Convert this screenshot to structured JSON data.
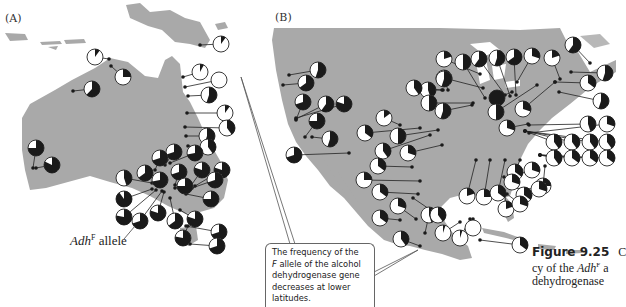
{
  "figure": {
    "panel_a_label": "(A)",
    "panel_b_label": "(B)",
    "allele_label": {
      "gene": "Adh",
      "superscript": "F",
      "suffix": " allele"
    },
    "callout_text": [
      "The frequency of the",
      "F allele of the alcohol",
      "dehydrogenase gene",
      "decreases at lower",
      "latitudes."
    ],
    "caption": {
      "number": "Figure 9.25",
      "lines": [
        "cy of the Adh",
        "dehydrogenase"
      ],
      "cut_first": "C",
      "superscript": "F",
      "line1_suffix": " a"
    }
  },
  "colors": {
    "land": "#a9a9a9",
    "pie_dark": "#1a1a1a",
    "pie_light": "#ffffff",
    "line": "#222222"
  },
  "chart_data": [
    {
      "type": "pie-map",
      "title": "(A) Australia — AdhF allele frequency",
      "legend": "Adh^F allele (dark sector)",
      "pies": [
        {
          "x": 95,
          "y": 57,
          "f": 0.1,
          "dot": [
            109,
            59
          ]
        },
        {
          "x": 123,
          "y": 77,
          "f": 0.25,
          "dot": [
            111,
            66
          ]
        },
        {
          "x": 92,
          "y": 89,
          "f": 0.62,
          "dot": [
            73,
            91
          ]
        },
        {
          "x": 221,
          "y": 44,
          "f": 0.1,
          "dot": [
            200,
            45
          ]
        },
        {
          "x": 200,
          "y": 72,
          "f": 0.08,
          "dot": [
            183,
            77
          ]
        },
        {
          "x": 219,
          "y": 80,
          "f": 0.0,
          "dot": [
            185,
            87
          ]
        },
        {
          "x": 209,
          "y": 95,
          "f": 0.55,
          "dot": [
            188,
            96
          ]
        },
        {
          "x": 225,
          "y": 113,
          "f": 0.1,
          "dot": [
            187,
            113
          ]
        },
        {
          "x": 227,
          "y": 128,
          "f": 0.4,
          "dot": [
            185,
            127
          ]
        },
        {
          "x": 207,
          "y": 136,
          "f": 0.55,
          "dot": [
            186,
            136
          ]
        },
        {
          "x": 36,
          "y": 148,
          "f": 0.75,
          "dot": [
            33,
            168
          ]
        },
        {
          "x": 52,
          "y": 165,
          "f": 0.82,
          "dot": [
            36,
            168
          ]
        },
        {
          "x": 208,
          "y": 147,
          "f": 0.4,
          "dot": [
            188,
            146
          ]
        },
        {
          "x": 174,
          "y": 152,
          "f": 0.7,
          "dot": [
            165,
            165
          ]
        },
        {
          "x": 195,
          "y": 153,
          "f": 0.72,
          "dot": [
            170,
            163
          ]
        },
        {
          "x": 160,
          "y": 158,
          "f": 0.7,
          "dot": [
            155,
            170
          ]
        },
        {
          "x": 145,
          "y": 173,
          "f": 0.65,
          "dot": [
            158,
            176
          ]
        },
        {
          "x": 160,
          "y": 180,
          "f": 0.72,
          "dot": [
            160,
            175
          ]
        },
        {
          "x": 179,
          "y": 172,
          "f": 0.7,
          "dot": [
            175,
            185
          ]
        },
        {
          "x": 185,
          "y": 186,
          "f": 0.75,
          "dot": [
            175,
            188
          ]
        },
        {
          "x": 202,
          "y": 170,
          "f": 0.8,
          "dot": [
            190,
            187
          ]
        },
        {
          "x": 222,
          "y": 170,
          "f": 0.8,
          "dot": [
            195,
            186
          ]
        },
        {
          "x": 124,
          "y": 178,
          "f": 0.45,
          "dot": [
            152,
            183
          ]
        },
        {
          "x": 124,
          "y": 199,
          "f": 0.9,
          "dot": [
            152,
            189
          ]
        },
        {
          "x": 124,
          "y": 217,
          "f": 0.78,
          "dot": [
            156,
            190
          ]
        },
        {
          "x": 140,
          "y": 221,
          "f": 0.7,
          "dot": [
            162,
            191
          ]
        },
        {
          "x": 158,
          "y": 213,
          "f": 0.8,
          "dot": [
            164,
            192
          ]
        },
        {
          "x": 175,
          "y": 221,
          "f": 0.65,
          "dot": [
            170,
            198
          ]
        },
        {
          "x": 195,
          "y": 219,
          "f": 0.8,
          "dot": [
            180,
            210
          ]
        },
        {
          "x": 211,
          "y": 199,
          "f": 0.75,
          "dot": [
            186,
            194
          ]
        },
        {
          "x": 215,
          "y": 180,
          "f": 0.7,
          "dot": [
            192,
            188
          ]
        },
        {
          "x": 219,
          "y": 232,
          "f": 0.7,
          "dot": [
            186,
            226
          ]
        },
        {
          "x": 217,
          "y": 246,
          "f": 0.7,
          "dot": [
            190,
            244
          ]
        },
        {
          "x": 183,
          "y": 238,
          "f": 0.78,
          "dot": [
            188,
            226
          ]
        }
      ]
    },
    {
      "type": "pie-map",
      "title": "(B) North America — AdhF allele frequency",
      "pies": [
        {
          "x": 318,
          "y": 70,
          "f": 0.55,
          "dot": [
            289,
            75
          ]
        },
        {
          "x": 306,
          "y": 83,
          "f": 0.65,
          "dot": [
            283,
            85
          ]
        },
        {
          "x": 303,
          "y": 102,
          "f": 0.7,
          "dot": [
            296,
            120
          ]
        },
        {
          "x": 326,
          "y": 104,
          "f": 0.6,
          "dot": [
            296,
            119
          ]
        },
        {
          "x": 344,
          "y": 104,
          "f": 0.8,
          "dot": [
            296,
            118
          ]
        },
        {
          "x": 317,
          "y": 121,
          "f": 0.75,
          "dot": [
            305,
            137
          ]
        },
        {
          "x": 330,
          "y": 139,
          "f": 0.55,
          "dot": [
            312,
            137
          ]
        },
        {
          "x": 294,
          "y": 155,
          "f": 0.7,
          "dot": [
            349,
            153
          ]
        },
        {
          "x": 384,
          "y": 118,
          "f": 0.15,
          "dot": [
            400,
            125
          ]
        },
        {
          "x": 365,
          "y": 133,
          "f": 0.35,
          "dot": [
            420,
            128
          ]
        },
        {
          "x": 398,
          "y": 136,
          "f": 0.5,
          "dot": [
            438,
            130
          ]
        },
        {
          "x": 383,
          "y": 151,
          "f": 0.4,
          "dot": [
            430,
            135
          ]
        },
        {
          "x": 408,
          "y": 153,
          "f": 0.3,
          "dot": [
            442,
            145
          ]
        },
        {
          "x": 378,
          "y": 166,
          "f": 0.35,
          "dot": [
            412,
            167
          ]
        },
        {
          "x": 364,
          "y": 180,
          "f": 0.25,
          "dot": [
            420,
            181
          ]
        },
        {
          "x": 380,
          "y": 192,
          "f": 0.35,
          "dot": [
            418,
            194
          ]
        },
        {
          "x": 398,
          "y": 206,
          "f": 0.3,
          "dot": [
            416,
            219
          ]
        },
        {
          "x": 380,
          "y": 218,
          "f": 0.35,
          "dot": [
            400,
            220
          ]
        },
        {
          "x": 401,
          "y": 239,
          "f": 0.4,
          "dot": [
            420,
            246
          ]
        },
        {
          "x": 429,
          "y": 215,
          "f": 0.45,
          "dot": [
            425,
            233
          ]
        },
        {
          "x": 444,
          "y": 59,
          "f": 0.2,
          "dot": [
            480,
            74
          ]
        },
        {
          "x": 444,
          "y": 78,
          "f": 0.65,
          "dot": [
            483,
            88
          ]
        },
        {
          "x": 463,
          "y": 62,
          "f": 0.5,
          "dot": [
            485,
            98
          ]
        },
        {
          "x": 479,
          "y": 59,
          "f": 0.6,
          "dot": [
            505,
            95
          ]
        },
        {
          "x": 497,
          "y": 58,
          "f": 0.55,
          "dot": [
            510,
            96
          ]
        },
        {
          "x": 514,
          "y": 57,
          "f": 0.65,
          "dot": [
            516,
            95
          ]
        },
        {
          "x": 532,
          "y": 56,
          "f": 0.3,
          "dot": [
            517,
            82
          ]
        },
        {
          "x": 552,
          "y": 58,
          "f": 0.2,
          "dot": [
            560,
            79
          ]
        },
        {
          "x": 573,
          "y": 45,
          "f": 0.6,
          "dot": [
            590,
            63
          ]
        },
        {
          "x": 605,
          "y": 73,
          "f": 0.55,
          "dot": [
            571,
            72
          ]
        },
        {
          "x": 444,
          "y": 79,
          "f": 0.55,
          "dot": [
            448,
            90
          ]
        },
        {
          "x": 428,
          "y": 90,
          "f": 0.45,
          "dot": [
            443,
            90
          ]
        },
        {
          "x": 414,
          "y": 88,
          "f": 0.4,
          "dot": [
            442,
            90
          ]
        },
        {
          "x": 429,
          "y": 103,
          "f": 0.5,
          "dot": [
            473,
            103
          ]
        },
        {
          "x": 443,
          "y": 111,
          "f": 0.55,
          "dot": [
            472,
            105
          ]
        },
        {
          "x": 497,
          "y": 98,
          "f": 1.0,
          "dot": [
            512,
            92
          ]
        },
        {
          "x": 496,
          "y": 112,
          "f": 0.5,
          "dot": [
            537,
            85
          ]
        },
        {
          "x": 523,
          "y": 109,
          "f": 0.3,
          "dot": [
            555,
            82
          ]
        },
        {
          "x": 588,
          "y": 83,
          "f": 0.35,
          "dot": [
            555,
            82
          ]
        },
        {
          "x": 601,
          "y": 101,
          "f": 0.55,
          "dot": [
            559,
            92
          ]
        },
        {
          "x": 507,
          "y": 128,
          "f": 0.3,
          "dot": [
            528,
            124
          ]
        },
        {
          "x": 588,
          "y": 124,
          "f": 0.45,
          "dot": [
            529,
            125
          ]
        },
        {
          "x": 607,
          "y": 124,
          "f": 0.3,
          "dot": [
            529,
            133
          ]
        },
        {
          "x": 554,
          "y": 142,
          "f": 0.4,
          "dot": [
            525,
            131
          ]
        },
        {
          "x": 572,
          "y": 142,
          "f": 0.4,
          "dot": [
            525,
            131
          ]
        },
        {
          "x": 590,
          "y": 142,
          "f": 0.4,
          "dot": [
            525,
            131
          ]
        },
        {
          "x": 607,
          "y": 142,
          "f": 0.4,
          "dot": [
            525,
            131
          ]
        },
        {
          "x": 554,
          "y": 158,
          "f": 0.4,
          "dot": [
            540,
            155
          ]
        },
        {
          "x": 572,
          "y": 158,
          "f": 0.35,
          "dot": [
            540,
            155
          ]
        },
        {
          "x": 590,
          "y": 158,
          "f": 0.35,
          "dot": [
            540,
            155
          ]
        },
        {
          "x": 607,
          "y": 158,
          "f": 0.35,
          "dot": [
            540,
            155
          ]
        },
        {
          "x": 515,
          "y": 172,
          "f": 0.35,
          "dot": [
            520,
            160
          ]
        },
        {
          "x": 543,
          "y": 186,
          "f": 0.25,
          "dot": [
            545,
            166
          ]
        },
        {
          "x": 524,
          "y": 195,
          "f": 0.35,
          "dot": [
            510,
            180
          ]
        },
        {
          "x": 467,
          "y": 196,
          "f": 0.2,
          "dot": [
            476,
            160
          ]
        },
        {
          "x": 484,
          "y": 197,
          "f": 0.25,
          "dot": [
            490,
            160
          ]
        },
        {
          "x": 498,
          "y": 193,
          "f": 0.35,
          "dot": [
            505,
            160
          ]
        },
        {
          "x": 512,
          "y": 182,
          "f": 0.3,
          "dot": [
            504,
            177
          ]
        },
        {
          "x": 532,
          "y": 170,
          "f": 0.3,
          "dot": [
            510,
            177
          ]
        },
        {
          "x": 539,
          "y": 189,
          "f": 0.3,
          "dot": [
            510,
            188
          ]
        },
        {
          "x": 506,
          "y": 209,
          "f": 0.2,
          "dot": [
            505,
            195
          ]
        },
        {
          "x": 520,
          "y": 204,
          "f": 0.3,
          "dot": [
            507,
            194
          ]
        },
        {
          "x": 438,
          "y": 215,
          "f": 0.4,
          "dot": [
            413,
            198
          ]
        },
        {
          "x": 443,
          "y": 233,
          "f": 0.05,
          "dot": [
            460,
            222
          ]
        },
        {
          "x": 460,
          "y": 238,
          "f": 0.05,
          "dot": [
            470,
            219
          ]
        },
        {
          "x": 473,
          "y": 228,
          "f": 0.0,
          "dot": [
            473,
            219
          ]
        },
        {
          "x": 520,
          "y": 245,
          "f": 0.35,
          "dot": [
            480,
            240
          ]
        }
      ]
    }
  ]
}
